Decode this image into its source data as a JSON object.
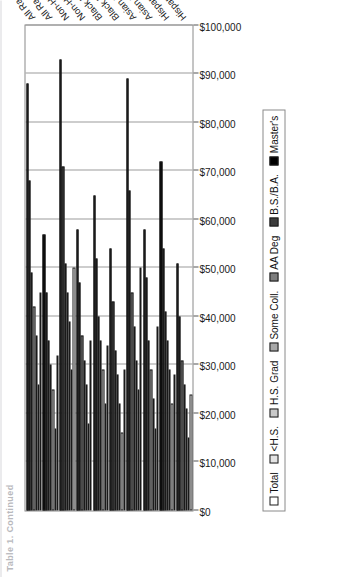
{
  "figure": {
    "title_sliver": "Table 1. Continued",
    "orientation": "rotated-90-ccw"
  },
  "legend": {
    "position": "below-plot",
    "items": [
      {
        "label": "Total",
        "class": "s0",
        "color": "#ffffff"
      },
      {
        "label": "<H.S.",
        "class": "s1",
        "color": "#e4e4e4"
      },
      {
        "label": "H.S. Grad",
        "class": "s2",
        "color": "#c9c9c9"
      },
      {
        "label": "Some Coll.",
        "class": "s3",
        "color": "#a8a8a8"
      },
      {
        "label": "AA Deg",
        "class": "s4",
        "color": "#7d7d7d"
      },
      {
        "label": "B.S./B.A.",
        "class": "s5",
        "color": "#3c3c3c"
      },
      {
        "label": "Master's",
        "class": "s6",
        "color": "#000000"
      }
    ]
  },
  "chart_data": {
    "type": "bar",
    "orientation": "horizontal",
    "title": "",
    "xlabel": "",
    "ylabel": "",
    "ylim": [
      0,
      100000
    ],
    "grid": true,
    "tick_labels": [
      "$0",
      "$10,000",
      "$20,000",
      "$30,000",
      "$40,000",
      "$50,000",
      "$60,000",
      "$70,000",
      "$80,000",
      "$90,000",
      "$100,000"
    ],
    "tick_values": [
      0,
      10000,
      20000,
      30000,
      40000,
      50000,
      60000,
      70000,
      80000,
      90000,
      100000
    ],
    "legend_position": "bottom",
    "categories": [
      "All Races Male",
      "All Races Female",
      "Non-Hispanic White Male",
      "Non-Hispanic White Female",
      "Black Male",
      "Black Female",
      "Asian Male",
      "Asian Female",
      "Hispanic Male (Any Race)",
      "Hispanic Female (Any Race)"
    ],
    "series": [
      {
        "name": "Total",
        "values": [
          45000,
          32000,
          50000,
          35000,
          34000,
          29000,
          50000,
          38000,
          28000,
          24000
        ]
      },
      {
        "name": "<H.S.",
        "values": [
          26000,
          17000,
          29000,
          18000,
          22000,
          16000,
          25000,
          17000,
          22000,
          15000
        ]
      },
      {
        "name": "H.S. Grad",
        "values": [
          36000,
          25000,
          39000,
          26000,
          29000,
          22000,
          31000,
          23000,
          29000,
          21000
        ]
      },
      {
        "name": "Some Coll.",
        "values": [
          42000,
          30000,
          45000,
          31000,
          35000,
          28000,
          38000,
          29000,
          35000,
          26000
        ]
      },
      {
        "name": "AA Deg",
        "values": [
          49000,
          35000,
          51000,
          36000,
          40000,
          33000,
          45000,
          35000,
          41000,
          31000
        ]
      },
      {
        "name": "B.S./B.A.",
        "values": [
          68000,
          45000,
          71000,
          47000,
          52000,
          43000,
          66000,
          48000,
          54000,
          40000
        ]
      },
      {
        "name": "Master's",
        "values": [
          88000,
          57000,
          93000,
          58000,
          65000,
          54000,
          89000,
          58000,
          72000,
          51000
        ]
      }
    ]
  }
}
